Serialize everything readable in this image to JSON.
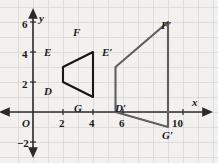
{
  "figure": {
    "background_color": "#f2f1ef",
    "grid_color": "#d3d2ce",
    "axis_color": "#2b2b2b",
    "preimage_color": "#161616",
    "image_color": "#5e5e5e"
  },
  "axes": {
    "x_label": "x",
    "y_label": "y",
    "origin_label": "O",
    "x_ticks": [
      {
        "value": 2,
        "label": "2"
      },
      {
        "value": 4,
        "label": "4"
      },
      {
        "value": 6,
        "label": "6"
      },
      {
        "value": 10,
        "label": "10"
      }
    ],
    "y_ticks": [
      {
        "value": 6,
        "label": "6"
      },
      {
        "value": 4,
        "label": "4"
      },
      {
        "value": 2,
        "label": "2"
      },
      {
        "value": -2,
        "label": "−2"
      }
    ],
    "x_range": [
      -1.2,
      12.3
    ],
    "y_range": [
      -3.4,
      7.2
    ],
    "grid": true,
    "grid_step": 1
  },
  "chart_data": {
    "type": "scatter",
    "xlabel": "x",
    "ylabel": "y",
    "xlim": [
      -1.2,
      12.3
    ],
    "ylim": [
      -3.4,
      7.2
    ],
    "grid": true,
    "legend": "none",
    "series": [
      {
        "name": "DEFG",
        "role": "preimage",
        "color": "#161616",
        "closed": true,
        "points": [
          {
            "label": "D",
            "x": 2,
            "y": 2
          },
          {
            "label": "E",
            "x": 2,
            "y": 3
          },
          {
            "label": "F",
            "x": 4,
            "y": 4
          },
          {
            "label": "G",
            "x": 4,
            "y": 1
          }
        ]
      },
      {
        "name": "D'E'F'G'",
        "role": "image",
        "color": "#5e5e5e",
        "closed": true,
        "points": [
          {
            "label": "D'",
            "x": 5.5,
            "y": 0
          },
          {
            "label": "E'",
            "x": 5.5,
            "y": 3
          },
          {
            "label": "F'",
            "x": 9,
            "y": 6
          },
          {
            "label": "G'",
            "x": 9,
            "y": -1
          }
        ]
      }
    ]
  },
  "vertex_labels": [
    {
      "name": "E",
      "text": "E",
      "x": 44,
      "y": 47
    },
    {
      "name": "F",
      "text": "F",
      "x": 73,
      "y": 27
    },
    {
      "name": "D",
      "text": "D",
      "x": 44,
      "y": 86
    },
    {
      "name": "G",
      "text": "G",
      "x": 74,
      "y": 103
    },
    {
      "name": "Ep",
      "text": "E′",
      "x": 102,
      "y": 47
    },
    {
      "name": "Fp",
      "text": "F′",
      "x": 161,
      "y": 20
    },
    {
      "name": "Dp",
      "text": "D′",
      "x": 115,
      "y": 103
    },
    {
      "name": "Gp",
      "text": "G′",
      "x": 162,
      "y": 130
    }
  ]
}
